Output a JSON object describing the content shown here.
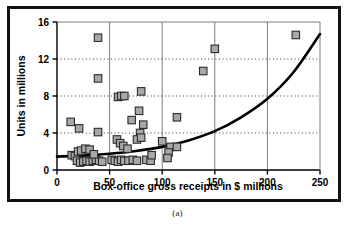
{
  "caption": "(a)",
  "colors": {
    "marker_fill": "#a8a8a8",
    "marker_stroke": "#2b2b2b",
    "curve": "#000000",
    "grid_h": "#333333",
    "grid_v": "#7d7d7d",
    "axis": "#000000",
    "frame": "#111111",
    "background": "#ffffff"
  },
  "chart_data": {
    "type": "scatter",
    "title": "",
    "xlabel": "Box-office gross receipts in $ millions",
    "ylabel": "Units in millions",
    "xlim": [
      0,
      250
    ],
    "ylim": [
      0,
      16
    ],
    "xticks": [
      0,
      50,
      100,
      150,
      200,
      250
    ],
    "yticks": [
      0,
      4,
      8,
      12,
      16
    ],
    "xtick_labels": [
      "0",
      "50",
      "100",
      "150",
      "200",
      "250"
    ],
    "ytick_labels": [
      "0",
      "4",
      "8",
      "12",
      "16"
    ],
    "grid": {
      "horizontal": "dotted",
      "vertical": "solid",
      "legend": "none"
    },
    "marker": {
      "shape": "square",
      "size": 7.5
    },
    "points": [
      {
        "x": 13,
        "y": 5.2
      },
      {
        "x": 21,
        "y": 4.5
      },
      {
        "x": 39,
        "y": 14.3
      },
      {
        "x": 39,
        "y": 9.9
      },
      {
        "x": 39,
        "y": 4.1
      },
      {
        "x": 58,
        "y": 7.9
      },
      {
        "x": 61,
        "y": 8.0
      },
      {
        "x": 64,
        "y": 8.0
      },
      {
        "x": 80,
        "y": 8.5
      },
      {
        "x": 78,
        "y": 6.4
      },
      {
        "x": 71,
        "y": 5.4
      },
      {
        "x": 82,
        "y": 4.9
      },
      {
        "x": 79,
        "y": 4.0
      },
      {
        "x": 114,
        "y": 5.7
      },
      {
        "x": 100,
        "y": 3.1
      },
      {
        "x": 139,
        "y": 10.7
      },
      {
        "x": 150,
        "y": 13.1
      },
      {
        "x": 227,
        "y": 14.6
      },
      {
        "x": 57,
        "y": 3.3
      },
      {
        "x": 60,
        "y": 2.9
      },
      {
        "x": 63,
        "y": 2.6
      },
      {
        "x": 76,
        "y": 3.3
      },
      {
        "x": 80,
        "y": 3.5
      },
      {
        "x": 108,
        "y": 2.5
      },
      {
        "x": 114,
        "y": 2.5
      },
      {
        "x": 106,
        "y": 1.9
      },
      {
        "x": 105,
        "y": 1.3
      },
      {
        "x": 14,
        "y": 1.6
      },
      {
        "x": 17,
        "y": 1.5
      },
      {
        "x": 20,
        "y": 2.0
      },
      {
        "x": 23,
        "y": 2.1
      },
      {
        "x": 27,
        "y": 2.3
      },
      {
        "x": 31,
        "y": 2.2
      },
      {
        "x": 19,
        "y": 1.0
      },
      {
        "x": 22,
        "y": 0.8
      },
      {
        "x": 25,
        "y": 0.9
      },
      {
        "x": 28,
        "y": 1.0
      },
      {
        "x": 31,
        "y": 0.9
      },
      {
        "x": 34,
        "y": 1.0
      },
      {
        "x": 37,
        "y": 1.1
      },
      {
        "x": 40,
        "y": 1.0
      },
      {
        "x": 43,
        "y": 0.9
      },
      {
        "x": 52,
        "y": 1.1
      },
      {
        "x": 55,
        "y": 1.0
      },
      {
        "x": 58,
        "y": 0.9
      },
      {
        "x": 61,
        "y": 1.1
      },
      {
        "x": 64,
        "y": 1.0
      },
      {
        "x": 68,
        "y": 1.0
      },
      {
        "x": 72,
        "y": 1.1
      },
      {
        "x": 76,
        "y": 1.0
      },
      {
        "x": 85,
        "y": 1.1
      },
      {
        "x": 89,
        "y": 1.0
      },
      {
        "x": 90,
        "y": 1.6
      },
      {
        "x": 67,
        "y": 2.3
      },
      {
        "x": 35,
        "y": 1.7
      }
    ],
    "fit_curve": {
      "label": "exponential trend",
      "points": [
        {
          "x": 0,
          "y": 1.45
        },
        {
          "x": 25,
          "y": 1.55
        },
        {
          "x": 50,
          "y": 1.75
        },
        {
          "x": 75,
          "y": 2.05
        },
        {
          "x": 100,
          "y": 2.5
        },
        {
          "x": 125,
          "y": 3.2
        },
        {
          "x": 150,
          "y": 4.2
        },
        {
          "x": 175,
          "y": 5.7
        },
        {
          "x": 200,
          "y": 7.7
        },
        {
          "x": 225,
          "y": 10.6
        },
        {
          "x": 250,
          "y": 14.7
        }
      ]
    }
  }
}
